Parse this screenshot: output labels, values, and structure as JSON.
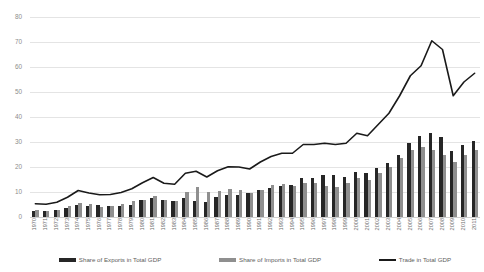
{
  "chart_data": {
    "type": "bar",
    "title": "",
    "subtitle": "",
    "xlabel": "",
    "ylabel": "",
    "ylim": [
      0,
      80
    ],
    "yticks": [
      0,
      10,
      20,
      30,
      40,
      50,
      60,
      70,
      80
    ],
    "grid": true,
    "legend_position": "bottom",
    "categories": [
      "1970",
      "1971",
      "1972",
      "1973",
      "1974",
      "1975",
      "1976",
      "1977",
      "1978",
      "1979",
      "1980",
      "1981",
      "1982",
      "1983",
      "1984",
      "1985",
      "1986",
      "1987",
      "1988",
      "1989",
      "1990",
      "1991",
      "1992",
      "1993",
      "1994",
      "1995",
      "1996",
      "1997",
      "1998",
      "1999",
      "2000",
      "2001",
      "2002",
      "2003",
      "2004",
      "2005",
      "2006",
      "2007",
      "2008",
      "2009",
      "2010",
      "2011"
    ],
    "series": [
      {
        "name": "Share of Exports in Total GDP",
        "type": "bar",
        "color": "#262626",
        "values": [
          2.6,
          2.5,
          3.0,
          3.6,
          5.0,
          4.3,
          4.7,
          4.6,
          4.6,
          5.0,
          7.0,
          7.5,
          6.8,
          6.6,
          7.5,
          6.3,
          6.0,
          8.0,
          8.8,
          9.0,
          9.6,
          11.0,
          11.5,
          12.3,
          13.0,
          15.5,
          15.5,
          17.0,
          17.0,
          16.0,
          18.0,
          17.5,
          19.5,
          21.5,
          25.0,
          29.5,
          32.5,
          33.5,
          32.0,
          26.5,
          29.0,
          30.5
        ]
      },
      {
        "name": "Share of Imports in Total GDP",
        "type": "bar",
        "color": "#8f8f8f",
        "values": [
          2.7,
          2.6,
          2.9,
          4.3,
          5.6,
          5.3,
          4.2,
          4.4,
          5.2,
          6.3,
          6.7,
          8.3,
          6.7,
          6.5,
          10.0,
          12.0,
          10.0,
          10.5,
          11.3,
          11.0,
          9.6,
          11.0,
          12.7,
          13.2,
          12.5,
          13.5,
          13.5,
          12.5,
          12.0,
          13.5,
          15.5,
          15.0,
          17.5,
          20.0,
          23.5,
          27.0,
          28.0,
          27.0,
          25.0,
          22.0,
          25.0,
          27.0
        ]
      },
      {
        "name": "Trade in Total GDP",
        "type": "line",
        "color": "#1a1a1a",
        "values": [
          5.3,
          5.1,
          5.9,
          7.9,
          10.6,
          9.6,
          8.9,
          9.0,
          9.8,
          11.3,
          13.7,
          15.8,
          13.5,
          13.1,
          17.5,
          18.3,
          16.0,
          18.5,
          20.1,
          20.0,
          19.2,
          22.0,
          24.2,
          25.5,
          25.5,
          29.0,
          29.0,
          29.5,
          29.0,
          29.5,
          33.5,
          32.5,
          37.0,
          41.5,
          48.5,
          56.5,
          60.5,
          70.5,
          67.0,
          48.5,
          54.0,
          57.5
        ]
      }
    ]
  },
  "legend": [
    {
      "label": "Share of Exports in Total GDP",
      "swatch": "bar-dark"
    },
    {
      "label": "Share of Imports in Total GDP",
      "swatch": "bar-light"
    },
    {
      "label": "Trade in Total GDP",
      "swatch": "line-dark"
    }
  ],
  "colors": {
    "exports": "#262626",
    "imports": "#8f8f8f",
    "trade_line": "#1a1a1a",
    "gridline": "#e4e4e4",
    "axis_text": "#6d6d6d",
    "background": "#ffffff"
  }
}
